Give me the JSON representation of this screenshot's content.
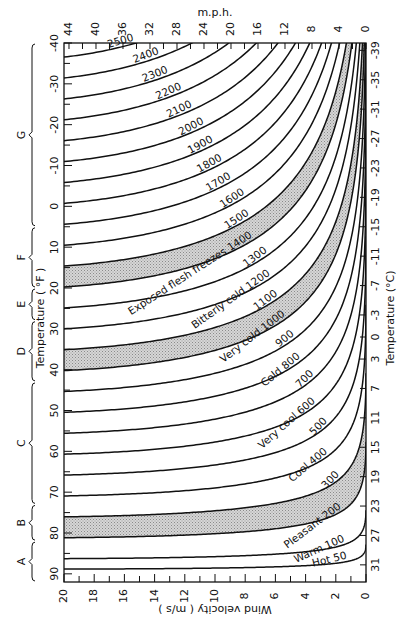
{
  "chart_data": {
    "type": "line",
    "orientation": "rotated 90° — temperature runs along the long (vertical) axis, wind velocity along the short (horizontal) axis, reversed",
    "axes": {
      "bottom": {
        "label": "Wind velocity ( m/s )",
        "ticks": [
          20,
          18,
          16,
          14,
          12,
          10,
          8,
          6,
          4,
          2,
          0
        ],
        "range": [
          20,
          0
        ]
      },
      "top": {
        "label": "m.p.h.",
        "ticks": [
          44,
          40,
          36,
          32,
          28,
          24,
          20,
          16,
          12,
          8,
          4,
          0
        ],
        "range": [
          44.7,
          0
        ]
      },
      "left": {
        "label": "Temperature ( °F )",
        "ticks": [
          -40,
          -30,
          -20,
          -10,
          0,
          10,
          20,
          30,
          40,
          50,
          60,
          70,
          80,
          90
        ],
        "range": [
          -40,
          92
        ]
      },
      "right": {
        "label": "Temperature (°C)",
        "ticks": [
          -39,
          -35,
          -31,
          -27,
          -23,
          -19,
          -15,
          -11,
          -7,
          -3,
          0,
          3,
          7,
          11,
          15,
          19,
          23,
          27,
          31
        ],
        "range": [
          -40,
          33
        ]
      }
    },
    "series": [
      {
        "name": "2500",
        "value": 2500,
        "shaded_band_below": false,
        "comfort_label": ""
      },
      {
        "name": "2400",
        "value": 2400,
        "shaded_band_below": false,
        "comfort_label": ""
      },
      {
        "name": "2300",
        "value": 2300,
        "shaded_band_below": false,
        "comfort_label": ""
      },
      {
        "name": "2200",
        "value": 2200,
        "shaded_band_below": false,
        "comfort_label": ""
      },
      {
        "name": "2100",
        "value": 2100,
        "shaded_band_below": false,
        "comfort_label": ""
      },
      {
        "name": "2000",
        "value": 2000,
        "shaded_band_below": false,
        "comfort_label": ""
      },
      {
        "name": "1900",
        "value": 1900,
        "shaded_band_below": false,
        "comfort_label": ""
      },
      {
        "name": "1800",
        "value": 1800,
        "shaded_band_below": false,
        "comfort_label": ""
      },
      {
        "name": "1700",
        "value": 1700,
        "shaded_band_below": false,
        "comfort_label": ""
      },
      {
        "name": "1600",
        "value": 1600,
        "shaded_band_below": false,
        "comfort_label": ""
      },
      {
        "name": "1500",
        "value": 1500,
        "shaded_band_below": true,
        "comfort_label": ""
      },
      {
        "name": "1400",
        "value": 1400,
        "shaded_band_below": true,
        "comfort_label": "Exposed flesh freezes"
      },
      {
        "name": "1300",
        "value": 1300,
        "shaded_band_below": false,
        "comfort_label": ""
      },
      {
        "name": "1200",
        "value": 1200,
        "shaded_band_below": false,
        "comfort_label": "Bitterly cold"
      },
      {
        "name": "1100",
        "value": 1100,
        "shaded_band_below": true,
        "comfort_label": ""
      },
      {
        "name": "1000",
        "value": 1000,
        "shaded_band_below": true,
        "comfort_label": "Very cold"
      },
      {
        "name": "900",
        "value": 900,
        "shaded_band_below": false,
        "comfort_label": ""
      },
      {
        "name": "800",
        "value": 800,
        "shaded_band_below": false,
        "comfort_label": "Cold"
      },
      {
        "name": "700",
        "value": 700,
        "shaded_band_below": false,
        "comfort_label": ""
      },
      {
        "name": "600",
        "value": 600,
        "shaded_band_below": false,
        "comfort_label": "Very cool"
      },
      {
        "name": "500",
        "value": 500,
        "shaded_band_below": false,
        "comfort_label": ""
      },
      {
        "name": "400",
        "value": 400,
        "shaded_band_below": false,
        "comfort_label": "Cool"
      },
      {
        "name": "300",
        "value": 300,
        "shaded_band_below": true,
        "comfort_label": ""
      },
      {
        "name": "200",
        "value": 200,
        "shaded_band_below": true,
        "comfort_label": "Pleasant"
      },
      {
        "name": "100",
        "value": 100,
        "shaded_band_below": false,
        "comfort_label": "Warm"
      },
      {
        "name": "50",
        "value": 50,
        "shaded_band_below": false,
        "comfort_label": "Hot"
      }
    ],
    "shaded_bands": [
      {
        "between": [
          1500,
          1400
        ],
        "label": "Exposed flesh freezes"
      },
      {
        "between": [
          1100,
          1000
        ],
        "label": "Very cold"
      },
      {
        "between": [
          300,
          200
        ],
        "label": "Pleasant"
      }
    ],
    "zones": [
      {
        "letter": "G",
        "temp_f_range": [
          -40,
          5
        ]
      },
      {
        "letter": "F",
        "temp_f_range": [
          5,
          20
        ]
      },
      {
        "letter": "E",
        "temp_f_range": [
          20,
          28
        ]
      },
      {
        "letter": "D",
        "temp_f_range": [
          28,
          43
        ]
      },
      {
        "letter": "C",
        "temp_f_range": [
          43,
          73
        ]
      },
      {
        "letter": "B",
        "temp_f_range": [
          73,
          82
        ]
      },
      {
        "letter": "A",
        "temp_f_range": [
          82,
          92
        ]
      }
    ],
    "grid": false,
    "legend": "none (curves labelled inline)"
  },
  "labels": {
    "top_axis_title": "m.p.h.",
    "bottom_axis_title": "Wind velocity ( m/s )",
    "left_axis_title": "Temperature ( °F )",
    "right_axis_title": "Temperature (°C)"
  },
  "colors": {
    "line": "#111111",
    "band_fill": "#c8c8c8",
    "background": "#ffffff"
  }
}
